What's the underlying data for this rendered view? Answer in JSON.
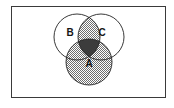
{
  "figure": {
    "kind": "venn-diagram",
    "set_count": 3,
    "frame": {
      "border_color": "#3a3a3a",
      "fill_color": "#ffffff",
      "x": 11,
      "y": 6,
      "width": 155,
      "height": 92
    },
    "circles": [
      {
        "id": "B",
        "label": "B",
        "cx": 77,
        "cy": 37,
        "r": 23,
        "label_x": 70,
        "label_y": 33,
        "stroke": "#232323",
        "fill": "#ffffff"
      },
      {
        "id": "C",
        "label": "C",
        "cx": 101,
        "cy": 37,
        "r": 23,
        "label_x": 102,
        "label_y": 33,
        "stroke": "#232323",
        "fill": "#ffffff"
      },
      {
        "id": "A",
        "label": "A",
        "cx": 89,
        "cy": 62,
        "r": 23,
        "label_x": 89,
        "label_y": 64,
        "stroke": "#232323",
        "fill": "#ffffff"
      }
    ],
    "regions": [
      {
        "id": "B-only",
        "expression": "B only",
        "shading": "none"
      },
      {
        "id": "C-only",
        "expression": "C only",
        "shading": "none"
      },
      {
        "id": "A-only",
        "expression": "A only",
        "shading": "hatch"
      },
      {
        "id": "A-and-B",
        "expression": "A and B",
        "shading": "hatch"
      },
      {
        "id": "A-and-C",
        "expression": "A and C",
        "shading": "hatch"
      },
      {
        "id": "B-and-C",
        "expression": "B and C",
        "shading": "hatch"
      },
      {
        "id": "A-and-B-and-C",
        "expression": "A and B and C",
        "shading": "solid-dark"
      }
    ],
    "shading": {
      "hatch_color": "#6e6e6e",
      "hatch_background": "#ffffff",
      "solid_dark_color": "#3c3c3c"
    },
    "labels": {
      "a": "A",
      "b": "B",
      "c": "C"
    }
  }
}
